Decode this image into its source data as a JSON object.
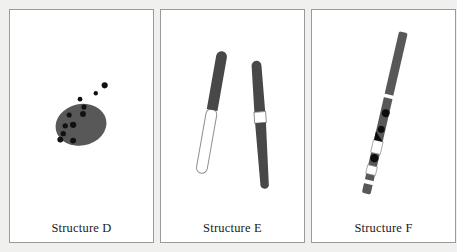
{
  "figure": {
    "background_color": "#f0f0ef",
    "panel_background": "#ffffff",
    "panel_border_color": "#9a9a9a",
    "ink_gray": "#585858",
    "ink_black": "#111111",
    "outline_gray": "#8d8d8d",
    "panels": [
      {
        "id": "panel-d",
        "caption": "Structure D",
        "diagram_name": "structure-d-diagram",
        "description": "Large dark gray oval body with a scatter of small black dots trailing away toward the upper right",
        "elements": {
          "body": {
            "name": "oval-body",
            "cx": 78,
            "cy": 128,
            "rx": 26,
            "ry": 21,
            "rotate": -12,
            "fill": "#585858"
          },
          "dots": [
            {
              "cx": 102,
              "cy": 88,
              "r": 3.1
            },
            {
              "cx": 93,
              "cy": 96,
              "r": 2.2
            },
            {
              "cx": 77,
              "cy": 102,
              "r": 2.4
            },
            {
              "cx": 81,
              "cy": 110,
              "r": 2.6
            },
            {
              "cx": 66,
              "cy": 118,
              "r": 2.6
            },
            {
              "cx": 80,
              "cy": 117,
              "r": 3.0
            },
            {
              "cx": 62,
              "cy": 129,
              "r": 2.7
            },
            {
              "cx": 70,
              "cy": 128,
              "r": 3.2
            },
            {
              "cx": 60,
              "cy": 137,
              "r": 2.7
            },
            {
              "cx": 57,
              "cy": 143,
              "r": 3.0
            },
            {
              "cx": 70,
              "cy": 144,
              "r": 3.0
            }
          ]
        }
      },
      {
        "id": "panel-e",
        "caption": "Structure E",
        "diagram_name": "structure-e-diagram",
        "description": "Two slender rods: the left rod dark gray on its upper half and hollow white on its lower half; the right rod dark gray with a single white band crossing its middle",
        "elements": {
          "rod_left": {
            "name": "rod-left",
            "top_segment_fill": "#484848",
            "bottom_segment_fill": "#ffffff",
            "outline": "#8d8d8d",
            "angle_deg": 10,
            "length": 160,
            "width": 11
          },
          "rod_right": {
            "name": "rod-right",
            "segment_fill": "#484848",
            "band_fill": "#ffffff",
            "outline": "#8d8d8d",
            "band_position_pct": 47,
            "angle_deg": -4,
            "length": 150,
            "width": 10
          }
        }
      },
      {
        "id": "panel-f",
        "caption": "Structure F",
        "diagram_name": "structure-f-diagram",
        "description": "One long diagonal rod running lower-left to upper-right, built from dark gray segments interrupted by white gaps and overlaid with solid black dots and a black wedge",
        "elements": {
          "rod": {
            "name": "banded-rod",
            "segment_fill": "#585858",
            "gap_fill": "#ffffff",
            "spot_fill": "#0d0d0d",
            "outline": "#8d8d8d",
            "angle_deg": 13,
            "width": 9
          },
          "gaps_pct": [
            40,
            60,
            74,
            85
          ],
          "spots": [
            {
              "name": "spot-1",
              "pos_pct": 47,
              "r": 4.0
            },
            {
              "name": "spot-2",
              "pos_pct": 57,
              "r": 3.6
            },
            {
              "name": "spot-3",
              "pos_pct": 64,
              "r": 3.6,
              "shape": "wedge"
            },
            {
              "name": "spot-4",
              "pos_pct": 77,
              "r": 4.2
            }
          ]
        }
      }
    ]
  }
}
